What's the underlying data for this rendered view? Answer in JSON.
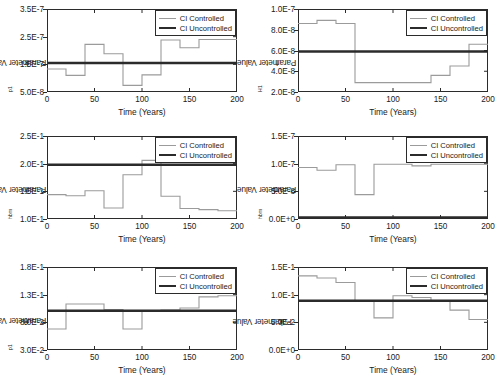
{
  "figure": {
    "legend": {
      "controlled_label": "CI Controlled",
      "uncontrolled_label": "CI Uncontrolled",
      "controlled_color": "#9b9b9b",
      "uncontrolled_color": "#2b2b2b"
    },
    "xlabel": "Time (Years)"
  },
  "chart_data": [
    {
      "type": "line",
      "panel": "top-left",
      "title": "",
      "ylabel_main": "k",
      "ylabel_sub": "p1",
      "ylabel": "k_p1 Parameter Value",
      "xlabel": "Time (Years)",
      "xlim": [
        0,
        200
      ],
      "ylim": [
        5e-08,
        3.5e-07
      ],
      "xticks": [
        0,
        50,
        100,
        150,
        200
      ],
      "xticklabels": [
        "0",
        "50",
        "100",
        "150",
        "200"
      ],
      "yticks": [
        5e-08,
        1.5e-07,
        2.5e-07,
        3.5e-07
      ],
      "yticklabels": [
        "5.0E-8",
        "1.5E-7",
        "2.5E-7",
        "3.5E-7"
      ],
      "grid": false,
      "legend_position": "upper right",
      "series": [
        {
          "name": "CI Controlled",
          "style": "step",
          "color": "#9b9b9b",
          "x": [
            0,
            20,
            40,
            60,
            80,
            100,
            120,
            140,
            160,
            180,
            200
          ],
          "values": [
            1.33e-07,
            1.1e-07,
            2.22e-07,
            1.88e-07,
            7.4e-08,
            1.12e-07,
            2.38e-07,
            2.1e-07,
            2.4e-07,
            2.4e-07
          ]
        },
        {
          "name": "CI Uncontrolled",
          "style": "constant",
          "color": "#2b2b2b",
          "value": 1.55e-07
        }
      ]
    },
    {
      "type": "line",
      "panel": "top-right",
      "title": "",
      "ylabel_main": "I",
      "ylabel_sub": "H1",
      "ylabel": "I_H1 Parameter Value",
      "xlabel": "Time (Years)",
      "xlim": [
        0,
        200
      ],
      "ylim": [
        2e-08,
        1e-07
      ],
      "xticks": [
        0,
        50,
        100,
        150,
        200
      ],
      "xticklabels": [
        "0",
        "50",
        "100",
        "150",
        "200"
      ],
      "yticks": [
        2e-08,
        4e-08,
        6e-08,
        8e-08,
        1e-07
      ],
      "yticklabels": [
        "2.0E-8",
        "4.0E-8",
        "6.0E-8",
        "8.0E-8",
        "1.0E-7"
      ],
      "grid": false,
      "legend_position": "upper right",
      "series": [
        {
          "name": "CI Controlled",
          "style": "step",
          "color": "#9b9b9b",
          "x": [
            0,
            20,
            40,
            60,
            80,
            100,
            120,
            140,
            160,
            180,
            200
          ],
          "values": [
            8.6e-08,
            8.9e-08,
            8.6e-08,
            2.9e-08,
            2.9e-08,
            2.9e-08,
            2.9e-08,
            3.6e-08,
            4.5e-08,
            6.6e-08
          ]
        },
        {
          "name": "CI Uncontrolled",
          "style": "constant",
          "color": "#2b2b2b",
          "value": 5.9e-08
        }
      ]
    },
    {
      "type": "line",
      "panel": "middle-left",
      "title": "",
      "ylabel_main": "λ",
      "ylabel_sub": "hbm",
      "ylabel": "λ_hbm Parameter Value",
      "xlabel": "Time (Years)",
      "xlim": [
        0,
        200
      ],
      "ylim": [
        0.1,
        0.25
      ],
      "xticks": [
        0,
        50,
        100,
        150,
        200
      ],
      "xticklabels": [
        "0",
        "50",
        "100",
        "150",
        "200"
      ],
      "yticks": [
        0.1,
        0.15,
        0.2,
        0.25
      ],
      "yticklabels": [
        "1.0E-1",
        "1.5E-1",
        "2.0E-1",
        "2.5E-1"
      ],
      "grid": false,
      "legend_position": "upper right",
      "series": [
        {
          "name": "CI Controlled",
          "style": "step",
          "color": "#9b9b9b",
          "x": [
            0,
            20,
            40,
            60,
            80,
            100,
            120,
            140,
            160,
            180,
            200
          ],
          "values": [
            0.144,
            0.142,
            0.151,
            0.12,
            0.18,
            0.206,
            0.141,
            0.119,
            0.117,
            0.115
          ]
        },
        {
          "name": "CI Uncontrolled",
          "style": "constant",
          "color": "#2b2b2b",
          "value": 0.198
        }
      ]
    },
    {
      "type": "line",
      "panel": "middle-right",
      "title": "",
      "ylabel_main": "d",
      "ylabel_sub": "hbm",
      "ylabel": "d_hbm Parameter Value",
      "xlabel": "Time (Years)",
      "xlim": [
        0,
        200
      ],
      "ylim": [
        0.0,
        1.5e-07
      ],
      "xticks": [
        0,
        50,
        100,
        150,
        200
      ],
      "xticklabels": [
        "0",
        "50",
        "100",
        "150",
        "200"
      ],
      "yticks": [
        0.0,
        5e-08,
        1e-07,
        1.5e-07
      ],
      "yticklabels": [
        "0.0E+0",
        "5.0E-8",
        "1.0E-7",
        "1.5E-7"
      ],
      "grid": false,
      "legend_position": "upper right",
      "series": [
        {
          "name": "CI Controlled",
          "style": "step",
          "color": "#9b9b9b",
          "x": [
            0,
            20,
            40,
            60,
            80,
            100,
            120,
            140,
            160,
            180,
            200
          ],
          "values": [
            9.3e-08,
            8.8e-08,
            9.8e-08,
            4.4e-08,
            9.9e-08,
            9.9e-08,
            9.6e-08,
            9.9e-08,
            9.9e-08,
            9.9e-08
          ]
        },
        {
          "name": "CI Uncontrolled",
          "style": "constant",
          "color": "#2b2b2b",
          "value": 3e-09
        }
      ]
    },
    {
      "type": "line",
      "panel": "bottom-left",
      "title": "",
      "ylabel_main": "θ",
      "ylabel_sub": "p1",
      "ylabel": "θ_p1 Parameter Value",
      "xlabel": "Time (Years)",
      "xlim": [
        0,
        200
      ],
      "ylim": [
        0.03,
        0.18
      ],
      "xticks": [
        0,
        50,
        100,
        150,
        200
      ],
      "xticklabels": [
        "0",
        "50",
        "100",
        "150",
        "200"
      ],
      "yticks": [
        0.03,
        0.08,
        0.13,
        0.18
      ],
      "yticklabels": [
        "3.0E-2",
        "8.0E-2",
        "1.3E-1",
        "1.8E-1"
      ],
      "grid": false,
      "legend_position": "upper right",
      "series": [
        {
          "name": "CI Controlled",
          "style": "step",
          "color": "#9b9b9b",
          "x": [
            0,
            20,
            40,
            60,
            80,
            100,
            120,
            140,
            160,
            180,
            200
          ],
          "values": [
            0.068,
            0.113,
            0.113,
            0.103,
            0.068,
            0.1,
            0.102,
            0.106,
            0.126,
            0.128
          ]
        },
        {
          "name": "CI Uncontrolled",
          "style": "constant",
          "color": "#2b2b2b",
          "value": 0.101
        }
      ]
    },
    {
      "type": "line",
      "panel": "bottom-right",
      "title": "",
      "ylabel_main": "k",
      "ylabel_sub": "",
      "ylabel": "k Parameter Value",
      "xlabel": "Time (Years)",
      "xlim": [
        0,
        200
      ],
      "ylim": [
        0.0,
        0.15
      ],
      "xticks": [
        0,
        50,
        100,
        150,
        200
      ],
      "xticklabels": [
        "0",
        "50",
        "100",
        "150",
        "200"
      ],
      "yticks": [
        0.0,
        0.05,
        0.1,
        0.15
      ],
      "yticklabels": [
        "0.0E+0",
        "5.0E-2",
        "1.0E-1",
        "1.5E-1"
      ],
      "grid": false,
      "legend_position": "upper right",
      "series": [
        {
          "name": "CI Controlled",
          "style": "step",
          "color": "#9b9b9b",
          "x": [
            0,
            20,
            40,
            60,
            80,
            100,
            120,
            140,
            160,
            180,
            200
          ],
          "values": [
            0.134,
            0.13,
            0.122,
            0.089,
            0.058,
            0.098,
            0.095,
            0.088,
            0.072,
            0.055
          ]
        },
        {
          "name": "CI Uncontrolled",
          "style": "constant",
          "color": "#2b2b2b",
          "value": 0.089
        }
      ]
    }
  ]
}
